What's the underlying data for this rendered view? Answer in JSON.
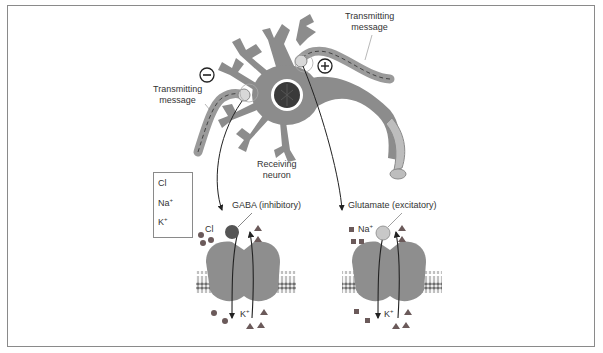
{
  "diagram": {
    "type": "neuron synaptic signaling diagram",
    "labels": {
      "transmitting_left": [
        "Transmitting",
        "message"
      ],
      "transmitting_right": [
        "Transmitting",
        "message"
      ],
      "receiving_neuron": [
        "Receiving",
        "neuron"
      ],
      "gaba": "GABA (inhibitory)",
      "glutamate": "Glutamate (excitatory)",
      "minus_sign": "−",
      "plus_sign": "+"
    },
    "legend": [
      {
        "ion": "Cl",
        "charge": "",
        "symbol": "circle"
      },
      {
        "ion": "Na",
        "charge": "+",
        "symbol": "square"
      },
      {
        "ion": "K",
        "charge": "+",
        "symbol": "triangle"
      }
    ],
    "channels": [
      {
        "name": "GABA channel",
        "ion_in_label": "Cl",
        "ion_in_charge": "",
        "ion_out_label": "K",
        "ion_out_charge": "+"
      },
      {
        "name": "Glutamate channel",
        "ion_in_label": "Na",
        "ion_in_charge": "+",
        "ion_out_label": "K",
        "ion_out_charge": "+"
      }
    ],
    "colors": {
      "border": "#8a8a8a",
      "neuron": "#8c8c8c",
      "nucleus": "#3a3a3a",
      "channel": "#8e8e8e",
      "membrane_head": "#6e6e6e",
      "ion": "#6b5a5a",
      "text": "#333333"
    }
  }
}
